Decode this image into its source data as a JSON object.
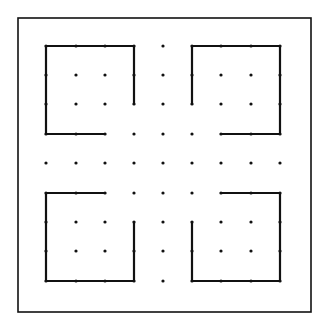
{
  "diagram": {
    "title": "",
    "type": "dot-grid puzzle",
    "colors": {
      "line": "#111111",
      "background": "#ffffff"
    },
    "frame": {
      "x": 18,
      "y": 18,
      "width": 293,
      "height": 294
    },
    "grid": {
      "columns": 9,
      "rows": 9,
      "x": [
        46,
        76,
        105,
        134,
        163,
        192,
        221,
        251,
        280
      ],
      "y": [
        46,
        75,
        104,
        134,
        163,
        193,
        222,
        251,
        281
      ]
    },
    "shapes": [
      {
        "name": "top-left-open-square",
        "points": [
          [
            2,
            3
          ],
          [
            0,
            3
          ],
          [
            0,
            0
          ],
          [
            3,
            0
          ],
          [
            3,
            2
          ]
        ]
      },
      {
        "name": "top-right-open-square",
        "points": [
          [
            5,
            2
          ],
          [
            5,
            0
          ],
          [
            8,
            0
          ],
          [
            8,
            3
          ],
          [
            6,
            3
          ]
        ]
      },
      {
        "name": "bottom-left-open-square",
        "points": [
          [
            2,
            5
          ],
          [
            0,
            5
          ],
          [
            0,
            8
          ],
          [
            3,
            8
          ],
          [
            3,
            6
          ]
        ]
      },
      {
        "name": "bottom-right-open-square",
        "points": [
          [
            5,
            6
          ],
          [
            5,
            8
          ],
          [
            8,
            8
          ],
          [
            8,
            5
          ],
          [
            6,
            5
          ]
        ]
      }
    ]
  }
}
